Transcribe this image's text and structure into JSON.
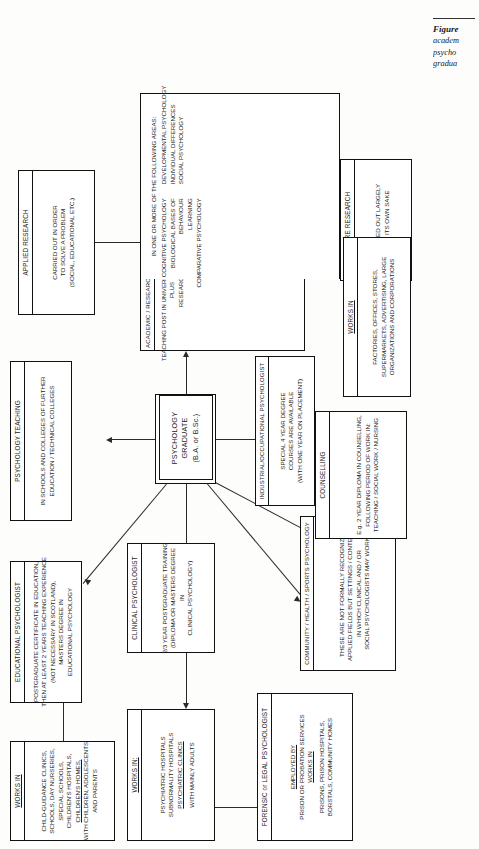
{
  "figure": {
    "caption_lines": [
      "Figure",
      "academ",
      "psycho",
      "gradua"
    ]
  },
  "center": {
    "line1": "PSYCHOLOGY",
    "line2": "GRADUATE",
    "line3": "(B.A. or B.Sc.)"
  },
  "nodes": {
    "educational_psychologist": {
      "header": "EDUCATIONAL PSYCHOLOGIST",
      "body": [
        "POSTGRADUATE CERTIFICATE IN EDUCATION,",
        "THEN AT LEAST 2 YEARS TEACHING EXPERIENCE",
        "(NOT NECESSARY IN SCOTLAND),",
        "MASTERS DEGREE IN",
        "EDUCATIONAL PSYCHOLOGY"
      ]
    },
    "educational_works_in": {
      "header": "WORKS IN",
      "body": [
        "CHILD-GUIDANCE CLINICS,",
        "SCHOOLS, DAY NURSERIES,",
        "SPECIAL SCHOOLS,",
        "CHILDREN'S HOSPITALS,",
        "CHILDREN'S HOMES,",
        "WITH CHILDREN, ADOLESCENTS",
        "AND PARENTS"
      ]
    },
    "psychology_teaching": {
      "header": "PSYCHOLOGY TEACHING",
      "body": [
        "IN SCHOOLS AND COLLEGES OF FURTHER",
        "EDUCATION / TECHNICAL COLLEGES"
      ]
    },
    "applied_research": {
      "header": "APPLIED RESEARCH",
      "body": [
        "CARRIED OUT IN ORDER",
        "TO SOLVE A PROBLEM",
        "(SOCIAL, EDUCATIONAL ETC.)"
      ]
    },
    "clinical_psychologist": {
      "header": "CLINICAL PSYCHOLOGIST",
      "body": [
        "2/3 YEAR POSTGRADUATE TRAINING",
        "(DIPLOMA OR MASTERS DEGREE",
        "IN",
        "CLINICAL PSYCHOLOGY)"
      ]
    },
    "clinical_works_in": {
      "header": "WORKS IN:",
      "body": [
        "PSYCHIATRIC HOSPITALS",
        "SUBNORMALITY HOSPITALS",
        "PSYCHIATRIC CLINICS",
        "WITH MAINLY ADULTS"
      ]
    },
    "academic_research": {
      "header": "ACADEMIC / RESEARCH PSYCHOLOGIST",
      "body": [
        "TEACHING POST IN UNIVERSITY / POLYTECHNIC",
        "PLUS",
        "RESEARCH"
      ],
      "areas_lead": "IN ONE OR MORE OF THE FOLLOWING AREAS:",
      "areas_left": [
        "COGNITIVE PSYCHOLOGY",
        "BIOLOGICAL BASES OF",
        "BEHAVIOUR",
        "LEARNING",
        "COMPARATIVE PSYCHOLOGY"
      ],
      "areas_right": [
        "DEVELOPMENTAL PSYCHOLOGY",
        "INDIVIDUAL DIFFERENCES",
        "SOCIAL PSYCHOLOGY"
      ]
    },
    "pure_research": {
      "header": "PURE RESEARCH",
      "body": [
        "CARRIED OUT LARGELY",
        "FOR ITS OWN SAKE"
      ]
    },
    "forensic_legal": {
      "header": "FORENSIC or LEGAL PSYCHOLOGIST",
      "body": [
        "EMPLOYED BY",
        "PRISON OR PROBATION SERVICES",
        "WORKS IN",
        "PRISONS, PRISON HOSPITALS,",
        "BORSTALS, COMMUNITY HOMES"
      ]
    },
    "community_health_sports": {
      "header": "COMMUNITY / HEALTH / SPORTS PSYCHOLOGY",
      "body": [
        "THESE ARE NOT FORMALLY RECOGNIZED",
        "APPLIED FIELDS BUT SETTINGS / CONTEXTS",
        "IN WHICH CLINICAL AND / OR",
        "SOCIAL PSYCHOLOGISTS MAY WORK"
      ]
    },
    "counselling": {
      "header": "COUNSELLING",
      "body": [
        "E.g. 2 YEAR DIPLOMA IN COUNSELLING,",
        "FOLLOWING PERIOD OF WORK IN:",
        "TEACHING / SOCIAL WORK / NURSING"
      ]
    },
    "industrial_occupational": {
      "header": "INDUSTRIAL/OCCUPATIONAL PSYCHOLOGIST",
      "body": [
        "SPECIAL 4 YEAR DEGREE",
        "COURSES ARE AVAILABLE",
        "(WITH ONE YEAR ON PLACEMENT)"
      ]
    },
    "industrial_works_in": {
      "header": "WORKS IN",
      "body": [
        "FACTORIES, OFFICES, STORES,",
        "SUPERMARKETS, ADVERTISING, LARGE",
        "ORGANIZATIONS AND CORPORATIONS"
      ]
    }
  },
  "colors": {
    "ink": "#111111",
    "line": "#2a2a2a",
    "paper": "#fdfdfc"
  }
}
